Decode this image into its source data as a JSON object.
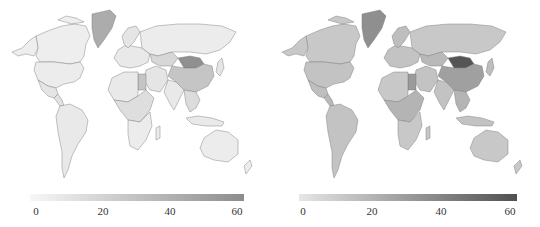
{
  "chart_data": [
    {
      "type": "heatmap",
      "subtype": "choropleth-world-map",
      "title": "",
      "colorbar": {
        "min": 0,
        "max": 60,
        "ticks": [
          "0",
          "20",
          "40",
          "60"
        ],
        "colors": [
          "#f7f7f7",
          "#8c8c8c"
        ]
      },
      "regions": [
        {
          "name": "Canada",
          "value": 5
        },
        {
          "name": "Alaska",
          "value": 5
        },
        {
          "name": "Greenland",
          "value": 42
        },
        {
          "name": "United States",
          "value": 6
        },
        {
          "name": "Mexico",
          "value": 10
        },
        {
          "name": "Central America",
          "value": 12
        },
        {
          "name": "South America",
          "value": 8
        },
        {
          "name": "Europe",
          "value": 8
        },
        {
          "name": "Scandinavia",
          "value": 10
        },
        {
          "name": "Russia",
          "value": 6
        },
        {
          "name": "Kazakhstan",
          "value": 18
        },
        {
          "name": "Mongolia",
          "value": 58
        },
        {
          "name": "China",
          "value": 28
        },
        {
          "name": "Middle East",
          "value": 10
        },
        {
          "name": "Egypt",
          "value": 28
        },
        {
          "name": "North Africa",
          "value": 8
        },
        {
          "name": "Central Africa",
          "value": 14
        },
        {
          "name": "Southern Africa",
          "value": 6
        },
        {
          "name": "Madagascar",
          "value": 6
        },
        {
          "name": "India",
          "value": 8
        },
        {
          "name": "Southeast Asia",
          "value": 15
        },
        {
          "name": "Indonesia",
          "value": 8
        },
        {
          "name": "Japan",
          "value": 10
        },
        {
          "name": "Australia",
          "value": 6
        },
        {
          "name": "New Zealand",
          "value": 6
        }
      ]
    },
    {
      "type": "heatmap",
      "subtype": "choropleth-world-map",
      "title": "",
      "colorbar": {
        "min": 0,
        "max": 60,
        "ticks": [
          "0",
          "20",
          "40",
          "60"
        ],
        "colors": [
          "#e6e6e6",
          "#505050"
        ]
      },
      "regions": [
        {
          "name": "Canada",
          "value": 12
        },
        {
          "name": "Alaska",
          "value": 12
        },
        {
          "name": "Greenland",
          "value": 35
        },
        {
          "name": "United States",
          "value": 14
        },
        {
          "name": "Mexico",
          "value": 16
        },
        {
          "name": "Central America",
          "value": 18
        },
        {
          "name": "South America",
          "value": 14
        },
        {
          "name": "Europe",
          "value": 14
        },
        {
          "name": "Scandinavia",
          "value": 16
        },
        {
          "name": "Russia",
          "value": 12
        },
        {
          "name": "Kazakhstan",
          "value": 18
        },
        {
          "name": "Mongolia",
          "value": 58
        },
        {
          "name": "China",
          "value": 28
        },
        {
          "name": "Middle East",
          "value": 14
        },
        {
          "name": "Egypt",
          "value": 30
        },
        {
          "name": "North Africa",
          "value": 12
        },
        {
          "name": "Central Africa",
          "value": 20
        },
        {
          "name": "Southern Africa",
          "value": 12
        },
        {
          "name": "Madagascar",
          "value": 12
        },
        {
          "name": "India",
          "value": 14
        },
        {
          "name": "Southeast Asia",
          "value": 20
        },
        {
          "name": "Indonesia",
          "value": 14
        },
        {
          "name": "Japan",
          "value": 16
        },
        {
          "name": "Australia",
          "value": 12
        },
        {
          "name": "New Zealand",
          "value": 12
        }
      ]
    }
  ]
}
